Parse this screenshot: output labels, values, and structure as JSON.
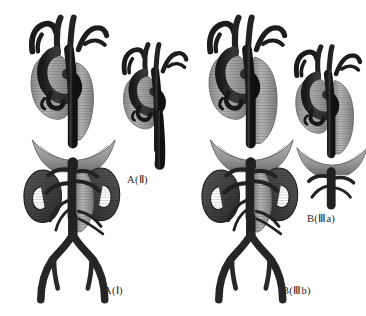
{
  "figure": {
    "background_color": "#ffffff",
    "title": ""
  },
  "palette": {
    "background": "#ffffff",
    "aorta_lumen_light": "#a9a9a9",
    "aorta_lumen_light_edge": "#8d8d8d",
    "stent_graft_dark": "#2b2b2b",
    "vessel_dark": "#303030",
    "vessel_dark_edge": "#161616",
    "kidney": "#4a4a4a",
    "kidney_edge": "#2a2a2a",
    "diaphragm": "#9a9a9a",
    "diaphragm_edge": "#6e6e6e",
    "label_text": "#262626"
  },
  "panels": [
    {
      "id": "a1",
      "label": "A(Ⅰ)",
      "label_x": 104,
      "label_y": 284,
      "scope": "full",
      "parts": [
        "aortic-arch",
        "arch-branch-vessels",
        "descending-thoracic-aorta",
        "stent-graft",
        "diaphragm",
        "kidney-left",
        "kidney-right",
        "renal-arteries",
        "abdominal-aorta",
        "iliac-bifurcation",
        "femoral-arteries"
      ]
    },
    {
      "id": "a2",
      "label": "A(Ⅱ)",
      "label_x": 127,
      "label_y": 173,
      "scope": "arch-only",
      "parts": [
        "aortic-arch",
        "arch-branch-vessels",
        "stent-graft",
        "descending-thoracic-aorta"
      ]
    },
    {
      "id": "b3a",
      "label": "B(Ⅲa)",
      "label_x": 307,
      "label_y": 212,
      "scope": "arch-and-diaphragm",
      "parts": [
        "aortic-arch",
        "arch-branch-vessels",
        "aneurysm-sac",
        "stent-graft",
        "diaphragm",
        "celiac-trunk",
        "visceral-branches"
      ]
    },
    {
      "id": "b3b",
      "label": "B(Ⅲb)",
      "label_x": 282,
      "label_y": 284,
      "scope": "full",
      "parts": [
        "aortic-arch",
        "arch-branch-vessels",
        "aneurysm-sac",
        "descending-thoracic-aorta",
        "stent-graft",
        "diaphragm",
        "kidney-left",
        "kidney-right",
        "renal-arteries",
        "abdominal-aorta",
        "iliac-bifurcation",
        "femoral-arteries"
      ]
    }
  ]
}
